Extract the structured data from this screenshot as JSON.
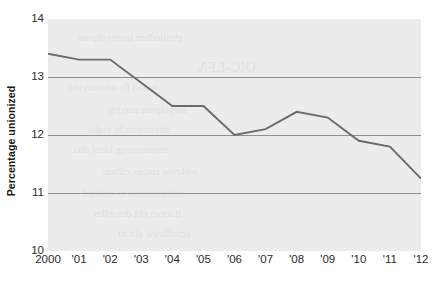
{
  "chart_data": {
    "type": "line",
    "title": "",
    "subtitle": "",
    "xlabel": "",
    "ylabel": "Percentage unionized",
    "categories": [
      "2000",
      "'01",
      "'02",
      "'03",
      "'04",
      "'05",
      "'06",
      "'07",
      "'08",
      "'09",
      "'10",
      "'11",
      "'12"
    ],
    "x_values": [
      2000,
      2001,
      2002,
      2003,
      2004,
      2005,
      2006,
      2007,
      2008,
      2009,
      2010,
      2011,
      2012
    ],
    "values": [
      13.4,
      13.3,
      13.3,
      12.9,
      12.5,
      12.5,
      12.0,
      12.1,
      12.4,
      12.3,
      11.9,
      11.8,
      11.25
    ],
    "series": [
      {
        "name": "Percentage unionized",
        "values": [
          13.4,
          13.3,
          13.3,
          12.9,
          12.5,
          12.5,
          12.0,
          12.1,
          12.4,
          12.3,
          11.9,
          11.8,
          11.25
        ],
        "color": "#6b6b6b"
      }
    ],
    "ylim": [
      10,
      14
    ],
    "xlim": [
      2000,
      2012
    ],
    "y_ticks": [
      10,
      11,
      12,
      13,
      14
    ],
    "y_tick_labels": [
      "10",
      "11",
      "12",
      "13",
      "14"
    ],
    "gridlines_y": [
      11,
      12,
      13
    ],
    "grid": true,
    "grid_axis": "y",
    "legend": false,
    "legend_position": "none",
    "annotations": [],
    "panel_color": "#ececeb",
    "line_color": "#6b6b6b",
    "grid_color": "#8f8f8f",
    "text_color": "#2b2b2b"
  },
  "axes": {
    "y_title": "Percentage unionized"
  },
  "bleed_through": {
    "note": "faint reversed text showing through from the other side of the printed page",
    "lines": [
      "ghniledbm tnemyolpme",
      "OIC-LFA",
      "noinu fo rebmun eht",
      "sreyolpme etavirp",
      "dezinoinu fo erahs",
      "tnemnrevog lacol dna",
      "srekrow rotces cilbup",
      "noitazinoinu ni enilced",
      "llarevo eht detcelfer",
      "ecrofkrow eht ni"
    ]
  }
}
